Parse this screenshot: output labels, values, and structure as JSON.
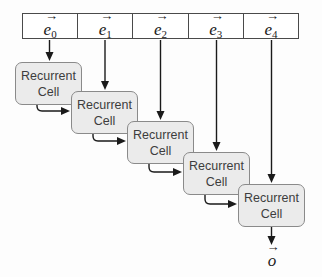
{
  "diagram": {
    "input_row": {
      "cells": [
        {
          "base": "e",
          "subscript": "0"
        },
        {
          "base": "e",
          "subscript": "1"
        },
        {
          "base": "e",
          "subscript": "2"
        },
        {
          "base": "e",
          "subscript": "3"
        },
        {
          "base": "e",
          "subscript": "4"
        }
      ]
    },
    "recurrent_cells": [
      {
        "label": "Recurrent Cell"
      },
      {
        "label": "Recurrent Cell"
      },
      {
        "label": "Recurrent Cell"
      },
      {
        "label": "Recurrent Cell"
      },
      {
        "label": "Recurrent Cell"
      }
    ],
    "output": {
      "base": "o"
    }
  },
  "colors": {
    "background": "#fdfdfd",
    "row_border": "#4a4a4a",
    "box_fill": "#ebebeb",
    "box_border": "#8a8a8a",
    "arrow": "#1a1a1a"
  }
}
